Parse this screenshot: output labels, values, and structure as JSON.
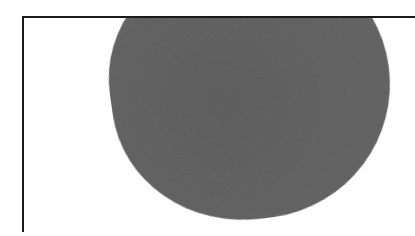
{
  "figure": {
    "colors": {
      "blob_fill": "#666666",
      "frame_line": "#1a1a1a",
      "background": "#ffffff"
    },
    "shapes": [
      {
        "type": "frame-line",
        "orientation": "horizontal",
        "x": 22,
        "y": 16,
        "length": 393
      },
      {
        "type": "frame-line",
        "orientation": "vertical",
        "x": 22,
        "y": 16,
        "length": 216
      },
      {
        "type": "blob",
        "approx_center": [
          250,
          70
        ],
        "approx_width": 280,
        "approx_bottom": 219,
        "clipped_top_at": 17
      }
    ]
  }
}
